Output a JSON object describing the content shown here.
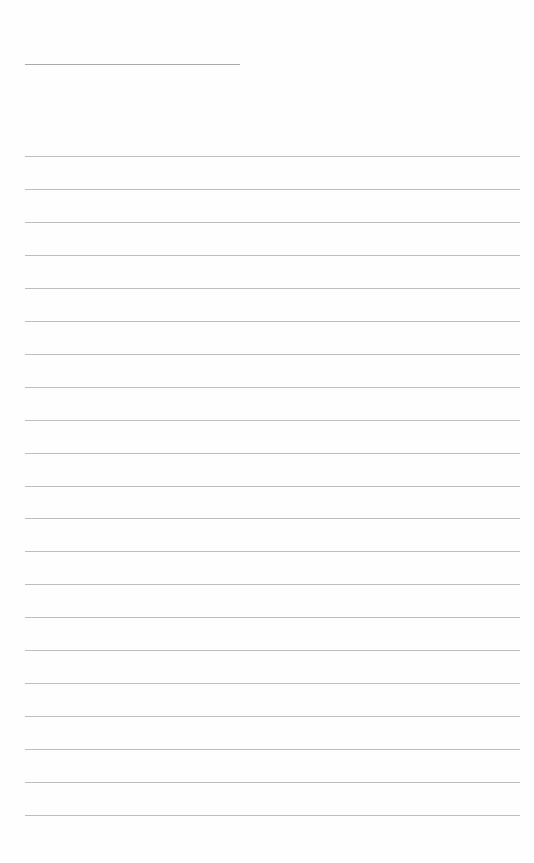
{
  "page": {
    "type": "lined-paper",
    "background_color": "#ffffff",
    "line_color": "#bdbdbd",
    "header_line": {
      "top": 64,
      "left": 25,
      "width": 215
    },
    "rules": {
      "count": 21,
      "first_top": 156,
      "spacing": 32.95,
      "left": 25,
      "width": 495
    }
  }
}
